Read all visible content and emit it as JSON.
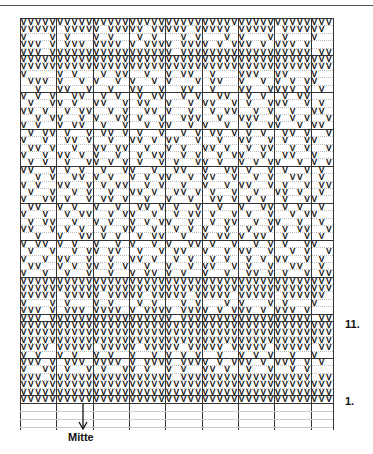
{
  "chart": {
    "columns": 43,
    "stitch_symbol": "V",
    "block_size": 5,
    "major_row_lines": [
      0,
      5,
      10,
      15,
      20,
      25,
      30,
      35,
      40,
      41,
      46,
      51
    ],
    "major_col_lines": [
      0,
      5,
      10,
      15,
      20,
      25,
      30,
      35,
      40,
      43
    ],
    "rows": [
      "VVVVVVVVVVVVVVVVVVVVVVVVVVVVVVVVVVVVVVVVVVV",
      "VVVVV.VVVVV.VVVVV.VVVVV.VVVVV.VVVVV.VVVVVV.",
      "V...V.V...V.V...V.V...V.V...V.V...V.V...V..",
      "VVV.V.VVV.VVVV.V.VVVV.VVVV.V.VVV.V.VVV.V...",
      "VVV.VVVVVVVVVVVVVVVVV.VVVVVVVVVVVVVVVVVV.VV",
      "VVVVVVVVVVVVVVVVVVVVVVVVVVVVVVVVVVVVVVVVVVV",
      "VVVVVVVVVVVVVVVVVVVVVVVVVVVVVVVVVVVVVVVVVVV",
      "V....V.V...V.VV..V..V.VV..V...VVV..VV...V..",
      ".VVV.V..V.V..V.V..V.V...V.VV..V..V.V.V.VV..",
      "..V..VV..V..V..VV..V..VV..V...VV..VVVV.V.V.",
      "V.V.V..VV..V.V..V.VV..V.V..VV..V.V..V.VV...",
      ".V..VV.V..VV..V.VV..V..V.VV..V.V..VVV..V.V.",
      "VV.V..V.VV..V.V..VV.V..V..V.VV..V.V..V..VV.",
      "..V.VV..V.V..VV.V..V..VVV..V..VVV..V.V.V..V",
      "V.V..V.VV..V..V..V.VV..V.V..V..V..VV..V.VV.",
      ".V.VV.V..V.VV.V.V..V..V.V.VV.V.V.V..VV.V..V",
      "V..V..VV.V..V..VV.V.VV..V..V..VV..V.V..VV..",
      ".VV.V..V..VV.VV..V..V.V..VV.V..V.VV..V.V..V",
      "V..V.VV.V.V..V..V.VV..V.V..V.VV..V..VV..V..",
      ".V.V..V..VV.V.V.V..V.V..VV.V..V.V.VV..V.V.V",
      "VV..V.V.V..V..VV..V..VV..V..VV.V..V.V..V.V.",
      "..V.V..VV.V.V..V.V.VV..V.VV..V..V.V..VV..V.",
      "V.V..VV..V.V.VV..V.V..V..V..V.VV..V.V..V.VV",
      ".V..V..V.V..V..VV.V..VV.V.V..V..V..VV.V..V.",
      "V..VV.V..V.VV.V..V..V..V..VV.V.V.V..V..VV..",
      ".VV..V.V..V..V..VV.V.V..V..V..V..VV.V.V..V.",
      "V..V..V.VV..V.VV..V..V.VV.V..V.V..V..V.VV..",
      ".V.VV..V..V.V..V.V.VV..V..V.VV..V.VV..V..V.",
      "VV..V.V.V..V..VV..V..V.V.V..V..V..V.V.VV..V",
      "..V..V..VV.V.V..V.VV..V..V.VV.V.VV..V..V.V.",
      "V.VV.V.V..V..V.V..V.V..VV.V..V..V.V.V..VV..",
      ".V..V..V.VV.VV..V..V.VV..V..V.VV..V..V.V..V",
      "V..V.VV..V..V..VV.V..V.V..V.V..V.V.VV..V.V.",
      ".VV..V.V.VV.V.V..V..V..V.VV..V.V..V..VV..V.",
      "V..V..V..V..V..V.VV.V.V..V..V..VV.V.V..V.VV",
      "VVVVVVVVVVVVVVVVVVVVVVVVVVVVVVVVVVVVVVVVVVV",
      "VVVVVVVVVVVVVVVVVVVVVVVVVVVVVVVVVVVVVVVVVVV",
      "VVVVV.VVVVV.VVVVV.VVVVV.VVVVV.VVVVV.VVVVVV.",
      "V...V.V...V.V...V.V...V.V...V.V...V.V...V..",
      "VVV.V.VVV.VVVV.V.VVVV.VVVV.V.VVV.V.VVV.V...",
      "VVV.VVVVVVVVVVVVVVVVV.VVVVVVVVVVVVVVVVVV.VV",
      "VVVVVVVVVVVVVVVVVVVVVVVVVVVVVVVVVVVVVVVVVVV",
      "VVVVVVVVVVVVVVVVVVVVVVVVVVVVVVVVVVVVVVVVVVV",
      "VVVVVVVVVVVVVVVVVVVVVVVVVVVVVVVVVVVVVVVVVVV",
      "VVVV.VVVVV.VVVVV.VVVVV.VVVVV.VVVVV.VVVVV.VV",
      "V.V..V.V..V.V..V..V.V.V.V..V..V.V.V..V..V..",
      "VVV.V.VVV.VVVV.V.VVVV.VVVV.V.VVV.V.VVV.V.V.",
      "V..VV.V..V.V..VV.V..V.V..VV.V..V..V..V.V...",
      "VVV.VVVVVVVVVVVVVVVVV.VVVVVVVVVVVVVVVVVV.VV",
      "VVVVVVVVVVVVVVVVVVVVVVVVVVVVVVVVVVVVVVVVVVV",
      "VVVVVVVVVVVVVVVVVVVVVVVVVVVVVVVVVVVVVVVVVVV",
      "VVVVVVVVVVVVVVVVVVVVVVVVVVVVVVVVVVVVVVVVVVV"
    ]
  },
  "labels": {
    "row_11": "11.",
    "row_1": "1.",
    "center": "Mitte"
  }
}
